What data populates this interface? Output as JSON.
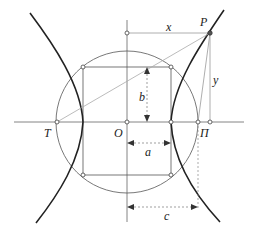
{
  "diagram": {
    "labels": {
      "P": "P",
      "T": "T",
      "O": "O",
      "Pi": "Π",
      "x": "x",
      "y": "y",
      "a": "a",
      "b": "b",
      "c": "c"
    },
    "colors": {
      "curve": "#222222",
      "line": "#555555",
      "light_line": "#aaaaaa",
      "point_fill": "#ffffff"
    }
  }
}
